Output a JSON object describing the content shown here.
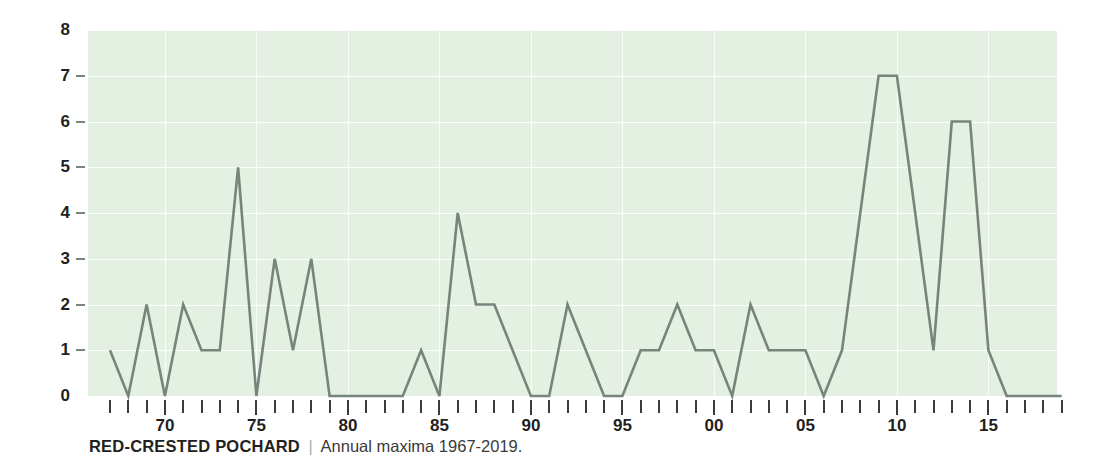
{
  "caption": {
    "species": "RED-CRESTED POCHARD",
    "divider": "|",
    "subtitle": "Annual maxima 1967-2019."
  },
  "colors": {
    "plot_background": "#e4f0e1",
    "grid": "#ffffff",
    "line": "#76847b",
    "axis_text": "#231f20",
    "tick": "#3b3b3b",
    "page_background": "#ffffff"
  },
  "axes": {
    "y_ticks": [
      0,
      1,
      2,
      3,
      4,
      5,
      6,
      7,
      8
    ],
    "y_tick_labels": [
      "0",
      "1",
      "2",
      "3",
      "4",
      "5",
      "6",
      "7",
      "8"
    ],
    "ylim": [
      0,
      8
    ],
    "x_major_labels": [
      "70",
      "75",
      "80",
      "85",
      "90",
      "95",
      "00",
      "05",
      "10",
      "15"
    ],
    "x_major_years": [
      1970,
      1975,
      1980,
      1985,
      1990,
      1995,
      2000,
      2005,
      2010,
      2015
    ],
    "xlim": [
      1967,
      2019
    ],
    "grid": "horizontal-and-vertical",
    "legend": "none"
  },
  "chart_data": {
    "type": "line",
    "title": "RED-CRESTED POCHARD",
    "subtitle": "Annual maxima 1967-2019.",
    "xlabel": "",
    "ylabel": "",
    "ylim": [
      0,
      8
    ],
    "xlim": [
      1967,
      2019
    ],
    "grid": true,
    "legend_position": "none",
    "x": [
      1967,
      1968,
      1969,
      1970,
      1971,
      1972,
      1973,
      1974,
      1975,
      1976,
      1977,
      1978,
      1979,
      1980,
      1981,
      1982,
      1983,
      1984,
      1985,
      1986,
      1987,
      1988,
      1989,
      1990,
      1991,
      1992,
      1993,
      1994,
      1995,
      1996,
      1997,
      1998,
      1999,
      2000,
      2001,
      2002,
      2003,
      2004,
      2005,
      2006,
      2007,
      2008,
      2009,
      2010,
      2011,
      2012,
      2013,
      2014,
      2015,
      2016,
      2017,
      2018,
      2019
    ],
    "x_tick_labels": [
      "",
      "",
      "",
      "70",
      "",
      "",
      "",
      "",
      "75",
      "",
      "",
      "",
      "",
      "80",
      "",
      "",
      "",
      "",
      "85",
      "",
      "",
      "",
      "",
      "90",
      "",
      "",
      "",
      "",
      "95",
      "",
      "",
      "",
      "",
      "00",
      "",
      "",
      "",
      "",
      "05",
      "",
      "",
      "",
      "",
      "10",
      "",
      "",
      "",
      "",
      "15",
      "",
      "",
      "",
      ""
    ],
    "values": [
      1,
      0,
      2,
      0,
      2,
      1,
      1,
      5,
      0,
      3,
      1,
      3,
      0,
      0,
      0,
      0,
      0,
      1,
      0,
      4,
      2,
      2,
      1,
      0,
      0,
      2,
      1,
      0,
      0,
      1,
      1,
      2,
      1,
      1,
      0,
      2,
      1,
      1,
      1,
      0,
      1,
      4,
      7,
      7,
      4,
      1,
      6,
      6,
      1,
      0,
      0,
      0,
      0
    ],
    "series": [
      {
        "name": "Annual maxima",
        "values": [
          1,
          0,
          2,
          0,
          2,
          1,
          1,
          5,
          0,
          3,
          1,
          3,
          0,
          0,
          0,
          0,
          0,
          1,
          0,
          4,
          2,
          2,
          1,
          0,
          0,
          2,
          1,
          0,
          0,
          1,
          1,
          2,
          1,
          1,
          0,
          2,
          1,
          1,
          1,
          0,
          1,
          4,
          7,
          7,
          4,
          1,
          6,
          6,
          1,
          0,
          0,
          0,
          0
        ]
      }
    ]
  }
}
